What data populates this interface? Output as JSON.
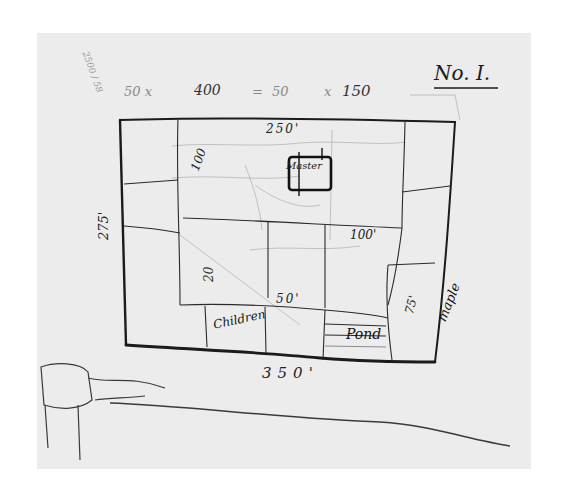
{
  "sketch": {
    "title": "No. I.",
    "top_calculation": [
      "50 x",
      "400",
      "=",
      "50",
      "x",
      "150"
    ],
    "corner_scribble": "2500 / 58",
    "perimeter_labels": {
      "top": "250'",
      "left": "275'",
      "bottom": "350'"
    },
    "interior_labels": {
      "house": "Master",
      "dim_100_vertical": "100",
      "dim_100_horizontal": "100'",
      "dim_75": "75'",
      "dim_50": "50'",
      "dim_20": "20"
    },
    "rooms": {
      "children": "Children",
      "pond": "Pond",
      "maple": "maple"
    },
    "colors": {
      "paper": "#ececec",
      "ink": "#1b1b1b",
      "faint_pencil": "#9a9a9a",
      "background": "#ffffff"
    }
  }
}
